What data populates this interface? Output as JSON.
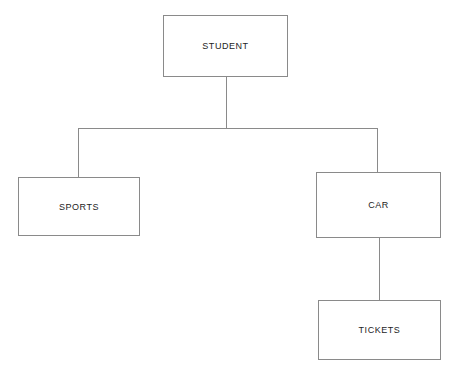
{
  "diagram": {
    "type": "tree",
    "background_color": "#ffffff",
    "line_color": "#8a8a8a",
    "text_color": "#1d1d1d",
    "nodes": [
      {
        "id": "student",
        "label": "STUDENT"
      },
      {
        "id": "sports",
        "label": "SPORTS"
      },
      {
        "id": "car",
        "label": "CAR"
      },
      {
        "id": "tickets",
        "label": "TICKETS"
      }
    ],
    "edges": [
      {
        "from": "student",
        "to": "sports",
        "style": "orthogonal"
      },
      {
        "from": "student",
        "to": "car",
        "style": "orthogonal"
      },
      {
        "from": "car",
        "to": "tickets",
        "style": "straight"
      }
    ]
  }
}
